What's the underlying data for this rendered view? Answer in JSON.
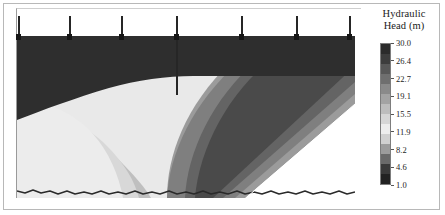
{
  "figure": {
    "width": 445,
    "height": 215,
    "background": "#ffffff"
  },
  "legend": {
    "title_line1": "Hydraulic",
    "title_line2": "Head (m)",
    "units": "m",
    "ticks": [
      "30.0",
      "26.4",
      "22.7",
      "19.1",
      "15.5",
      "11.9",
      "8.2",
      "4.6",
      "1.0"
    ],
    "tick_values": [
      30.0,
      26.4,
      22.7,
      19.1,
      15.5,
      11.9,
      8.2,
      4.6,
      1.0
    ],
    "vmin": 1.0,
    "vmax": 30.0,
    "colors": [
      "#2b2b2b",
      "#3d3d3d",
      "#585858",
      "#6f6f6f",
      "#8a8a8a",
      "#a3a3a3",
      "#bdbdbd",
      "#d6d6d6",
      "#ededed",
      "#d0d0d0",
      "#9c9c9c",
      "#6a6a6a",
      "#3a3a3a",
      "#222222"
    ]
  },
  "chart_data": {
    "type": "heatmap",
    "title": "Hydraulic Head (m)",
    "xlabel": "",
    "ylabel": "",
    "colorbar_label": "Hydraulic Head (m)",
    "zmin": 1.0,
    "zmax": 30.0,
    "grid": false,
    "legend_position": "right",
    "tick_labels": [
      "30.0",
      "26.4",
      "22.7",
      "19.1",
      "15.5",
      "11.9",
      "8.2",
      "4.6",
      "1.0"
    ],
    "contour_bands": [
      {
        "name": "band-30",
        "head_range": [
          26.4,
          30.0
        ],
        "color": "#2e2e2e"
      },
      {
        "name": "band-26",
        "head_range": [
          22.7,
          26.4
        ],
        "color": "#494949"
      },
      {
        "name": "band-23",
        "head_range": [
          19.1,
          22.7
        ],
        "color": "#636363"
      },
      {
        "name": "band-19",
        "head_range": [
          15.5,
          19.1
        ],
        "color": "#7e7e7e"
      },
      {
        "name": "band-16",
        "head_range": [
          11.9,
          15.5
        ],
        "color": "#9a9a9a"
      },
      {
        "name": "band-12",
        "head_range": [
          8.2,
          11.9
        ],
        "color": "#b2b2b2"
      },
      {
        "name": "band-8",
        "head_range": [
          4.6,
          8.2
        ],
        "color": "#c9c9c9"
      },
      {
        "name": "band-5",
        "head_range": [
          1.0,
          4.6
        ],
        "color": "#e4e4e4"
      }
    ],
    "wells": [
      {
        "id": "well-1",
        "x_px": 18,
        "deep": false
      },
      {
        "id": "well-2",
        "x_px": 69,
        "deep": false
      },
      {
        "id": "well-3",
        "x_px": 121,
        "deep": false
      },
      {
        "id": "well-4",
        "x_px": 176,
        "deep": true
      },
      {
        "id": "well-5",
        "x_px": 241,
        "deep": false
      },
      {
        "id": "well-6",
        "x_px": 296,
        "deep": false
      },
      {
        "id": "well-7",
        "x_px": 349,
        "deep": false
      }
    ]
  }
}
